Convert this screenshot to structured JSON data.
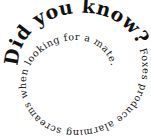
{
  "graphic": {
    "type": "spiral-text",
    "headline": "Did you know?",
    "fact": " Foxes produce alarming screams when looking for a mate.",
    "text_color": "#111111",
    "background_color": "#ffffff"
  }
}
